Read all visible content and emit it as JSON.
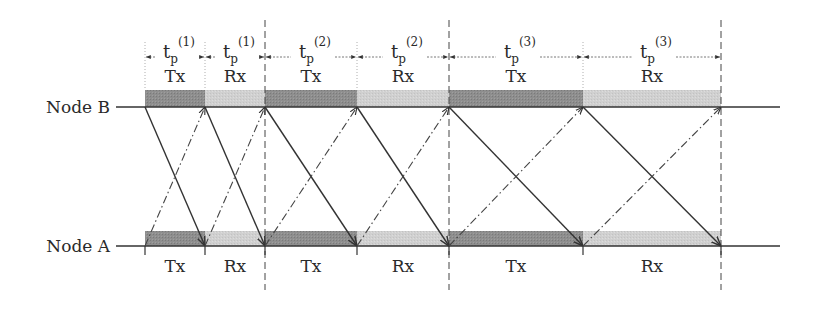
{
  "diagram": {
    "nodes": [
      {
        "id": "B",
        "label": "Node B",
        "y": 107
      },
      {
        "id": "A",
        "label": "Node A",
        "y": 246
      }
    ],
    "colors": {
      "tx_fill": "#8c8c8c",
      "rx_fill": "#cfcfcf",
      "line": "#3a3a3a"
    },
    "boundaries_x": [
      145,
      205,
      265,
      357,
      449,
      583,
      721
    ],
    "major_dividers_x": [
      265,
      449,
      721
    ],
    "intervals": [
      {
        "type": "Tx",
        "label_top": "Tx",
        "label_bottom": "Tx",
        "tp_base": "t",
        "tp_sub": "p",
        "tp_sup": "(1)"
      },
      {
        "type": "Rx",
        "label_top": "Rx",
        "label_bottom": "Rx",
        "tp_base": "t",
        "tp_sub": "p",
        "tp_sup": "(1)"
      },
      {
        "type": "Tx",
        "label_top": "Tx",
        "label_bottom": "Tx",
        "tp_base": "t",
        "tp_sub": "p",
        "tp_sup": "(2)"
      },
      {
        "type": "Rx",
        "label_top": "Rx",
        "label_bottom": "Rx",
        "tp_base": "t",
        "tp_sub": "p",
        "tp_sup": "(2)"
      },
      {
        "type": "Tx",
        "label_top": "Tx",
        "label_bottom": "Tx",
        "tp_base": "t",
        "tp_sub": "p",
        "tp_sup": "(3)"
      },
      {
        "type": "Rx",
        "label_top": "Rx",
        "label_bottom": "Rx",
        "tp_base": "t",
        "tp_sub": "p",
        "tp_sup": "(3)"
      }
    ],
    "signals": {
      "solid": "Node B to Node A (one per interval)",
      "dash_dot": "Node A to Node B (one per interval)"
    }
  }
}
